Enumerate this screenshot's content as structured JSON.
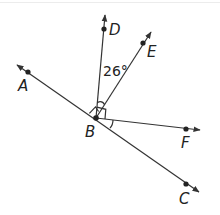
{
  "diagram": {
    "points": {
      "A": {
        "label": "A"
      },
      "B": {
        "label": "B"
      },
      "C": {
        "label": "C"
      },
      "D": {
        "label": "D"
      },
      "E": {
        "label": "E"
      },
      "F": {
        "label": "F"
      }
    },
    "angle_label": "26°",
    "rays": [
      "BA",
      "BC",
      "BD",
      "BE",
      "BF"
    ],
    "line": "AC",
    "right_angles": [
      "ABD",
      "DBF"
    ],
    "marked_equal_angles": [
      "DBE",
      "FBC"
    ],
    "stroke_color": "#333333"
  }
}
